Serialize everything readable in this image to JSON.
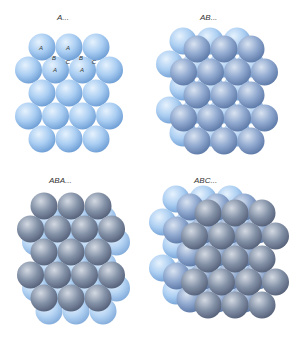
{
  "figure": {
    "panels": [
      {
        "id": "a",
        "title": "A...",
        "title_pos": [
          64,
          19
        ],
        "layers": [
          "A"
        ],
        "annotations": {
          "sphere_labels": [
            {
              "text": "A",
              "x": 41,
              "y": 48
            },
            {
              "text": "A",
              "x": 68,
              "y": 48
            },
            {
              "text": "A",
              "x": 55,
              "y": 70
            },
            {
              "text": "A",
              "x": 82,
              "y": 70
            }
          ],
          "hole_labels": [
            {
              "text": "B",
              "x": 54,
              "y": 58
            },
            {
              "text": "C",
              "x": 68,
              "y": 62
            },
            {
              "text": "B",
              "x": 81,
              "y": 58
            },
            {
              "text": "C",
              "x": 94,
              "y": 62
            }
          ]
        }
      },
      {
        "id": "ab",
        "title": "AB...",
        "title_pos": [
          208,
          19
        ],
        "layers": [
          "A",
          "B"
        ]
      },
      {
        "id": "aba",
        "title": "ABA...",
        "title_pos": [
          58,
          182
        ],
        "layers": [
          "A",
          "B",
          "A"
        ]
      },
      {
        "id": "abc",
        "title": "ABC...",
        "title_pos": [
          203,
          182
        ],
        "layers": [
          "A",
          "B",
          "C"
        ]
      }
    ]
  },
  "colors": {
    "light_sphere": "#a9cdf2",
    "light_sphere_highlight": "#e6f2fd",
    "light_sphere_shadow": "#6f9fd6",
    "mid_sphere": "#8fa8cf",
    "mid_sphere_highlight": "#d9e3f1",
    "mid_sphere_shadow": "#5e7aa8",
    "dark_sphere": "#8492a8",
    "dark_sphere_highlight": "#d3d9e2",
    "dark_sphere_shadow": "#56627a"
  }
}
